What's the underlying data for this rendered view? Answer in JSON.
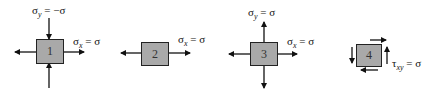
{
  "diagram": {
    "title": "",
    "colors": {
      "box_fill": "#a9a9a9",
      "box_border": "#222222",
      "arrow": "#111111",
      "background": "#ffffff"
    },
    "elements": [
      {
        "id": "1",
        "label": "1",
        "stress_labels": [
          {
            "symbol": "σ",
            "subscript": "y",
            "equals": " = −σ"
          },
          {
            "symbol": "σ",
            "subscript": "x",
            "equals": " = σ"
          }
        ],
        "arrows": [
          "left-outward",
          "right-outward",
          "top-inward",
          "bottom-inward"
        ]
      },
      {
        "id": "2",
        "label": "2",
        "stress_labels": [
          {
            "symbol": "σ",
            "subscript": "x",
            "equals": " = σ"
          }
        ],
        "arrows": [
          "left-outward",
          "right-outward"
        ]
      },
      {
        "id": "3",
        "label": "3",
        "stress_labels": [
          {
            "symbol": "σ",
            "subscript": "y",
            "equals": " = σ"
          },
          {
            "symbol": "σ",
            "subscript": "x",
            "equals": " = σ"
          }
        ],
        "arrows": [
          "left-outward",
          "right-outward",
          "top-outward",
          "bottom-outward"
        ]
      },
      {
        "id": "4",
        "label": "4",
        "stress_labels": [
          {
            "symbol": "τ",
            "subscript": "xy",
            "equals": " = σ"
          }
        ],
        "arrows": [
          "top-right-shear",
          "bottom-left-shear",
          "left-down-shear",
          "right-up-shear"
        ]
      }
    ]
  }
}
